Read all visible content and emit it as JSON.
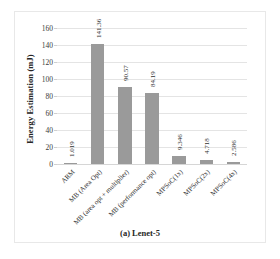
{
  "chart_data": {
    "type": "bar",
    "title": "",
    "caption": "(a) Lenet-5",
    "xlabel": "",
    "ylabel": "Energy Estimation (mJ)",
    "ylim": [
      0,
      170
    ],
    "yticks": [
      0,
      20,
      40,
      60,
      80,
      100,
      120,
      140,
      160
    ],
    "grid": true,
    "legend": "none",
    "bar_color": "#9a9a9a",
    "categories": [
      "ARM",
      "MB (Area Opt)",
      "MB (area opt + multiplier)",
      "MB (performance opt)",
      "MPSoC(1x)",
      "MPSoC(2x)",
      "MPSoC(4x)"
    ],
    "values": [
      1.019,
      141.36,
      90.57,
      84.19,
      9.346,
      4.718,
      2.586
    ],
    "value_labels": [
      "1.019",
      "141.36",
      "90.57",
      "84.19",
      "9.346",
      "4.718",
      "2.586"
    ]
  }
}
